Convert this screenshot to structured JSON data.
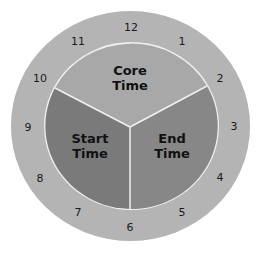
{
  "diagram": {
    "type": "clock-pie",
    "colors": {
      "ring": "#b5b5b5",
      "core": "#a8a8a8",
      "start": "#7a7a7a",
      "end": "#878787",
      "divider": "#f0f0f0"
    },
    "segments": [
      {
        "id": "core",
        "line1": "Core",
        "line2": "Time"
      },
      {
        "id": "start",
        "line1": "Start",
        "line2": "Time"
      },
      {
        "id": "end",
        "line1": "End",
        "line2": "Time"
      }
    ],
    "hours": [
      "12",
      "1",
      "2",
      "3",
      "4",
      "5",
      "6",
      "7",
      "8",
      "9",
      "10",
      "11"
    ]
  }
}
